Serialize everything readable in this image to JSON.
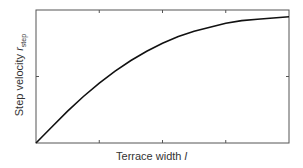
{
  "chart_data": {
    "type": "line",
    "title": "",
    "xlabel": "Terrace width l",
    "ylabel": "Step velocity r_step",
    "ylabel_main": "Step velocity ",
    "ylabel_var": "r",
    "ylabel_sub": "step",
    "xlabel_main": "Terrace width ",
    "xlabel_var": "l",
    "grid": false,
    "legend": null,
    "xlim": [
      0,
      4
    ],
    "ylim": [
      0,
      1
    ],
    "x_ticks": [
      1,
      2,
      3
    ],
    "y_ticks": [
      0.5
    ],
    "tick_labels_shown": false,
    "series": [
      {
        "name": "step velocity",
        "x": [
          0,
          0.25,
          0.5,
          0.75,
          1.0,
          1.25,
          1.5,
          1.75,
          2.0,
          2.25,
          2.5,
          2.75,
          3.0,
          3.25,
          3.5,
          3.75,
          4.0
        ],
        "y": [
          0,
          0.12,
          0.24,
          0.35,
          0.45,
          0.54,
          0.62,
          0.69,
          0.75,
          0.8,
          0.84,
          0.87,
          0.9,
          0.92,
          0.93,
          0.94,
          0.95
        ]
      }
    ],
    "line_color": "#111111"
  }
}
